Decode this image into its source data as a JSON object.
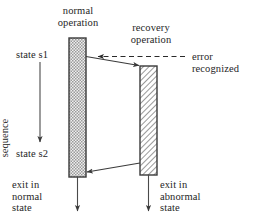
{
  "diagram": {
    "title_top": "normal\noperation",
    "labels": {
      "normal_operation": "normal\noperation",
      "recovery_operation": "recovery\noperation",
      "error_recognized": "error\nrecognized",
      "state_s1": "state s1",
      "state_s2": "state s2",
      "state_sequence": "state\nsequence",
      "exit_normal": "exit in\nnormal\nstate",
      "exit_abnormal": "exit in\nabnormal\nstate"
    },
    "bars": [
      {
        "name": "normal-operation-bar",
        "fill_pattern": "dotted",
        "x": 69,
        "y": 38,
        "width": 17,
        "height": 139,
        "stroke": "#3a3a3a",
        "fill": "#e8e8e8"
      },
      {
        "name": "recovery-operation-bar",
        "fill_pattern": "diagonal-hatch",
        "x": 140,
        "y": 66,
        "width": 17,
        "height": 109,
        "stroke": "#3a3a3a",
        "fill": "#ffffff"
      }
    ],
    "connectors": [
      {
        "name": "transfer-to-recovery-arrow",
        "from": [
          86,
          57
        ],
        "to": [
          140,
          66
        ],
        "style": "solid",
        "arrow": "end"
      },
      {
        "name": "return-to-normal-arrow",
        "from": [
          140,
          163
        ],
        "to": [
          86,
          172
        ],
        "style": "solid",
        "arrow": "end"
      },
      {
        "name": "error-recognized-arrow",
        "from": [
          184,
          57
        ],
        "to": [
          96,
          57
        ],
        "style": "dashed",
        "arrow": "end"
      },
      {
        "name": "state-sequence-arrow",
        "from": [
          40,
          62
        ],
        "to": [
          40,
          146
        ],
        "style": "solid",
        "arrow": "end"
      },
      {
        "name": "exit-normal-arrow",
        "from": [
          77,
          177
        ],
        "to": [
          77,
          215
        ],
        "style": "solid",
        "arrow": "end"
      },
      {
        "name": "exit-abnormal-arrow",
        "from": [
          148,
          175
        ],
        "to": [
          148,
          215
        ],
        "style": "solid",
        "arrow": "end"
      }
    ],
    "colors": {
      "line": "#3a3a3a",
      "text": "#262626",
      "background": "#ffffff",
      "bar_dotted_fill": "#e3e3e3",
      "bar_hatch_fill": "#ffffff"
    }
  }
}
